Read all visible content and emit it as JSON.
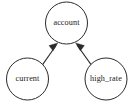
{
  "graph": {
    "type": "directed-graph",
    "background_color": "#ffffff",
    "node_fill_color": "#ffffff",
    "node_stroke_color": "#2b2b2b",
    "edge_color": "#2b2b2b",
    "label_color": "#1a1a1a",
    "nodes": [
      {
        "id": "account",
        "label": "account",
        "cx": 66.5,
        "cy": 23,
        "r": 21
      },
      {
        "id": "current",
        "label": "current",
        "cx": 27.5,
        "cy": 79,
        "r": 21
      },
      {
        "id": "high_rate",
        "label": "high_rate",
        "cx": 106,
        "cy": 79,
        "r": 21
      }
    ],
    "edges": [
      {
        "id": "current-to-account",
        "from": "current",
        "to": "account",
        "label": "",
        "arrow": "to",
        "path": "M 42.6 64.6 L 56.2 45.3",
        "head": "53.0,50.8 57.8,42.9 49.0,45.6"
      },
      {
        "id": "high_rate-to-account",
        "from": "high_rate",
        "to": "account",
        "label": "",
        "arrow": "to",
        "path": "M 91.1 64.6 L 77.2 45.3",
        "head": "80.4,50.8 75.6,42.9 84.4,45.6"
      }
    ]
  }
}
